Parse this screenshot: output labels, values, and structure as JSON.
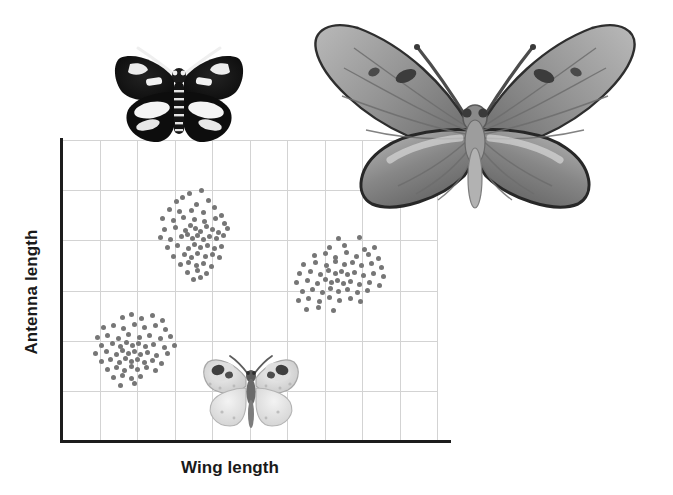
{
  "figure": {
    "background_color": "#ffffff"
  },
  "axes": {
    "xlabel": "Wing length",
    "ylabel": "Antenna length",
    "axis_color": "#1c1c1c",
    "grid_color": "#d3d3d3",
    "grid_on": true,
    "tick_labels_x": [],
    "tick_labels_y": []
  },
  "specimens": [
    {
      "name": "dark-moth",
      "description": "Black moth with white forewing and hindwing patches",
      "primary_color": "#111111",
      "accent_color": "#f2f2f2"
    },
    {
      "name": "large-butterfly",
      "description": "Large grey butterfly with dark scalloped wing margins",
      "primary_color": "#8d8d8d",
      "accent_color": "#3a3a3a"
    },
    {
      "name": "pale-butterfly",
      "description": "Small pale butterfly with dark eyespots on forewings",
      "primary_color": "#d8d8d8",
      "accent_color": "#4a4a4a"
    }
  ],
  "chart_data": {
    "type": "scatter",
    "title": "",
    "xlabel": "Wing length",
    "ylabel": "Antenna length",
    "xlim": [
      0,
      10
    ],
    "ylim": [
      0,
      6
    ],
    "grid": true,
    "legend": "none",
    "marker_color": "#767676",
    "marker_size": 5,
    "series": [
      {
        "name": "cluster-upper-left",
        "note": "Dark moth group: short wings, long antennae",
        "center": [
          3.4,
          4.5
        ],
        "spread": [
          0.62,
          0.55
        ],
        "correlation": 0.0,
        "n": 64,
        "points": [
          [
            3.4,
            4.93
          ],
          [
            3.72,
            4.99
          ],
          [
            3.04,
            4.78
          ],
          [
            3.22,
            4.85
          ],
          [
            3.58,
            4.72
          ],
          [
            3.9,
            4.8
          ],
          [
            2.86,
            4.62
          ],
          [
            3.14,
            4.58
          ],
          [
            3.46,
            4.6
          ],
          [
            3.78,
            4.55
          ],
          [
            4.06,
            4.66
          ],
          [
            4.24,
            4.5
          ],
          [
            2.68,
            4.44
          ],
          [
            2.96,
            4.4
          ],
          [
            3.24,
            4.46
          ],
          [
            3.52,
            4.42
          ],
          [
            3.8,
            4.38
          ],
          [
            4.08,
            4.44
          ],
          [
            4.32,
            4.34
          ],
          [
            2.74,
            4.22
          ],
          [
            3.02,
            4.26
          ],
          [
            3.3,
            4.2
          ],
          [
            3.42,
            4.3
          ],
          [
            3.56,
            4.24
          ],
          [
            3.68,
            4.18
          ],
          [
            3.86,
            4.28
          ],
          [
            4.02,
            4.22
          ],
          [
            4.18,
            4.16
          ],
          [
            4.4,
            4.24
          ],
          [
            2.62,
            4.06
          ],
          [
            2.9,
            4.02
          ],
          [
            3.18,
            4.08
          ],
          [
            3.34,
            4.12
          ],
          [
            3.48,
            4.04
          ],
          [
            3.62,
            4.1
          ],
          [
            3.76,
            4.02
          ],
          [
            3.94,
            4.08
          ],
          [
            4.12,
            4.04
          ],
          [
            4.3,
            4.1
          ],
          [
            2.8,
            3.86
          ],
          [
            3.08,
            3.9
          ],
          [
            3.36,
            3.84
          ],
          [
            3.54,
            3.92
          ],
          [
            3.7,
            3.86
          ],
          [
            3.88,
            3.9
          ],
          [
            4.06,
            3.84
          ],
          [
            4.26,
            3.88
          ],
          [
            2.98,
            3.68
          ],
          [
            3.26,
            3.72
          ],
          [
            3.44,
            3.66
          ],
          [
            3.6,
            3.74
          ],
          [
            3.82,
            3.68
          ],
          [
            4.0,
            3.72
          ],
          [
            4.2,
            3.66
          ],
          [
            3.16,
            3.52
          ],
          [
            3.38,
            3.56
          ],
          [
            3.58,
            3.5
          ],
          [
            3.78,
            3.54
          ],
          [
            3.98,
            3.48
          ],
          [
            3.34,
            3.36
          ],
          [
            3.62,
            3.4
          ],
          [
            3.86,
            3.34
          ],
          [
            3.5,
            3.22
          ],
          [
            3.7,
            3.26
          ]
        ]
      },
      {
        "name": "cluster-lower-left",
        "note": "Pale butterfly group: short wings, short antennae",
        "center": [
          1.9,
          1.85
        ],
        "spread": [
          0.66,
          0.5
        ],
        "correlation": 0.0,
        "n": 62,
        "points": [
          [
            1.6,
            2.46
          ],
          [
            1.86,
            2.52
          ],
          [
            2.12,
            2.44
          ],
          [
            2.4,
            2.5
          ],
          [
            2.68,
            2.4
          ],
          [
            1.1,
            2.26
          ],
          [
            1.36,
            2.3
          ],
          [
            1.64,
            2.24
          ],
          [
            1.92,
            2.32
          ],
          [
            2.2,
            2.26
          ],
          [
            2.48,
            2.3
          ],
          [
            2.76,
            2.22
          ],
          [
            0.94,
            2.06
          ],
          [
            1.22,
            2.1
          ],
          [
            1.5,
            2.04
          ],
          [
            1.78,
            2.12
          ],
          [
            2.06,
            2.06
          ],
          [
            2.34,
            2.1
          ],
          [
            2.62,
            2.04
          ],
          [
            2.9,
            2.08
          ],
          [
            1.06,
            1.9
          ],
          [
            1.34,
            1.94
          ],
          [
            1.56,
            1.88
          ],
          [
            1.72,
            1.96
          ],
          [
            1.88,
            1.9
          ],
          [
            2.04,
            1.94
          ],
          [
            2.22,
            1.88
          ],
          [
            2.44,
            1.92
          ],
          [
            2.72,
            1.86
          ],
          [
            3.0,
            1.9
          ],
          [
            0.9,
            1.74
          ],
          [
            1.18,
            1.78
          ],
          [
            1.44,
            1.72
          ],
          [
            1.62,
            1.8
          ],
          [
            1.78,
            1.74
          ],
          [
            1.94,
            1.78
          ],
          [
            2.1,
            1.72
          ],
          [
            2.28,
            1.76
          ],
          [
            2.52,
            1.7
          ],
          [
            2.8,
            1.74
          ],
          [
            1.04,
            1.58
          ],
          [
            1.3,
            1.62
          ],
          [
            1.52,
            1.56
          ],
          [
            1.7,
            1.64
          ],
          [
            1.86,
            1.58
          ],
          [
            2.02,
            1.62
          ],
          [
            2.2,
            1.56
          ],
          [
            2.42,
            1.6
          ],
          [
            2.66,
            1.54
          ],
          [
            1.2,
            1.42
          ],
          [
            1.46,
            1.46
          ],
          [
            1.66,
            1.4
          ],
          [
            1.84,
            1.48
          ],
          [
            2.02,
            1.42
          ],
          [
            2.24,
            1.46
          ],
          [
            2.5,
            1.4
          ],
          [
            1.38,
            1.26
          ],
          [
            1.62,
            1.3
          ],
          [
            1.86,
            1.24
          ],
          [
            2.1,
            1.28
          ],
          [
            1.56,
            1.1
          ],
          [
            1.94,
            1.14
          ]
        ]
      },
      {
        "name": "cluster-right",
        "note": "Large butterfly group: long wings, intermediate antennae; positively correlated",
        "center": [
          7.4,
          3.2
        ],
        "spread": [
          0.7,
          0.58
        ],
        "correlation": 0.65,
        "n": 62,
        "points": [
          [
            7.36,
            4.04
          ],
          [
            7.92,
            4.06
          ],
          [
            7.12,
            3.86
          ],
          [
            7.54,
            3.9
          ],
          [
            8.06,
            3.82
          ],
          [
            8.34,
            3.86
          ],
          [
            6.74,
            3.7
          ],
          [
            7.02,
            3.74
          ],
          [
            7.28,
            3.66
          ],
          [
            7.58,
            3.76
          ],
          [
            7.86,
            3.68
          ],
          [
            8.16,
            3.72
          ],
          [
            8.44,
            3.64
          ],
          [
            6.44,
            3.52
          ],
          [
            6.76,
            3.56
          ],
          [
            7.04,
            3.5
          ],
          [
            7.3,
            3.58
          ],
          [
            7.52,
            3.52
          ],
          [
            7.74,
            3.56
          ],
          [
            7.98,
            3.5
          ],
          [
            8.26,
            3.54
          ],
          [
            8.52,
            3.46
          ],
          [
            6.34,
            3.34
          ],
          [
            6.62,
            3.38
          ],
          [
            6.88,
            3.32
          ],
          [
            7.1,
            3.4
          ],
          [
            7.28,
            3.34
          ],
          [
            7.44,
            3.38
          ],
          [
            7.6,
            3.32
          ],
          [
            7.8,
            3.36
          ],
          [
            8.04,
            3.3
          ],
          [
            8.3,
            3.34
          ],
          [
            8.58,
            3.28
          ],
          [
            6.26,
            3.16
          ],
          [
            6.54,
            3.2
          ],
          [
            6.8,
            3.14
          ],
          [
            7.02,
            3.22
          ],
          [
            7.18,
            3.16
          ],
          [
            7.34,
            3.2
          ],
          [
            7.5,
            3.14
          ],
          [
            7.7,
            3.18
          ],
          [
            7.94,
            3.12
          ],
          [
            8.2,
            3.16
          ],
          [
            8.46,
            3.1
          ],
          [
            6.4,
            2.98
          ],
          [
            6.68,
            3.02
          ],
          [
            6.94,
            2.96
          ],
          [
            7.16,
            3.04
          ],
          [
            7.38,
            2.98
          ],
          [
            7.62,
            3.02
          ],
          [
            7.88,
            2.96
          ],
          [
            8.14,
            3.0
          ],
          [
            6.3,
            2.8
          ],
          [
            6.58,
            2.84
          ],
          [
            6.86,
            2.78
          ],
          [
            7.12,
            2.86
          ],
          [
            7.4,
            2.8
          ],
          [
            7.68,
            2.84
          ],
          [
            7.96,
            2.78
          ],
          [
            6.52,
            2.62
          ],
          [
            6.84,
            2.66
          ],
          [
            7.24,
            2.6
          ]
        ]
      }
    ]
  }
}
